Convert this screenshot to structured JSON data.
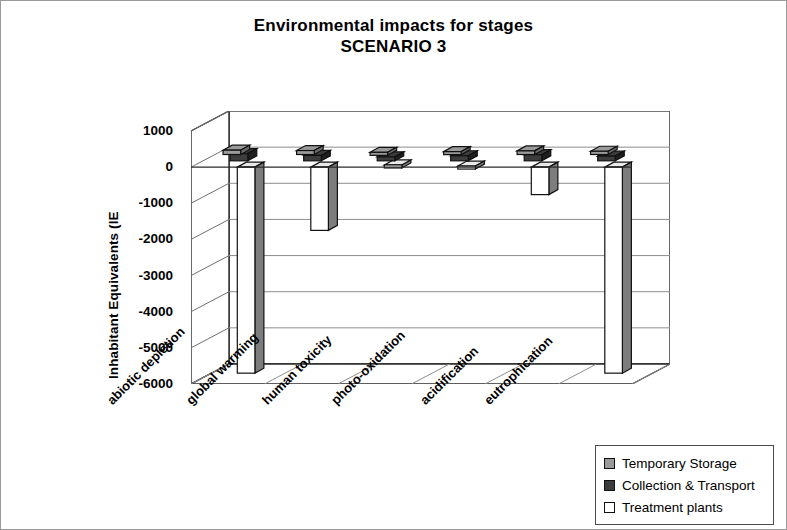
{
  "chart_data": {
    "type": "bar",
    "title": "Environmental impacts for stages",
    "subtitle": "SCENARIO 3",
    "xlabel": "",
    "ylabel": "Inhabitant Equivalents (IE",
    "ylim": [
      -6000,
      1000
    ],
    "yticks": [
      1000,
      0,
      -1000,
      -2000,
      -3000,
      -4000,
      -5000,
      -6000
    ],
    "ytick_labels": [
      "1000",
      "0",
      "-1000",
      "-2000",
      "-3000",
      "-4000",
      "-5000",
      "-6000"
    ],
    "grid": true,
    "legend_position": "bottom-right",
    "categories": [
      "abiotic depletion",
      "global warming",
      "human toxicity",
      "photo-oxidation",
      "acidification",
      "eutrophication"
    ],
    "series": [
      {
        "name": "Temporary Storage",
        "color": "#9a9a9a",
        "values": [
          120,
          110,
          60,
          80,
          100,
          90
        ]
      },
      {
        "name": "Collection & Transport",
        "color": "#3c3c3c",
        "values": [
          200,
          150,
          110,
          140,
          170,
          130
        ]
      },
      {
        "name": "Treatment plants",
        "color": "#ffffff",
        "values": [
          -5700,
          -1750,
          60,
          30,
          -760,
          -5700
        ]
      }
    ]
  },
  "title_block": {
    "line1": "Environmental impacts for stages",
    "line2": "SCENARIO 3"
  },
  "legend": {
    "items": [
      {
        "label": "Temporary Storage",
        "color": "#9a9a9a"
      },
      {
        "label": "Collection & Transport",
        "color": "#3c3c3c"
      },
      {
        "label": "Treatment plants",
        "color": "#ffffff"
      }
    ]
  }
}
